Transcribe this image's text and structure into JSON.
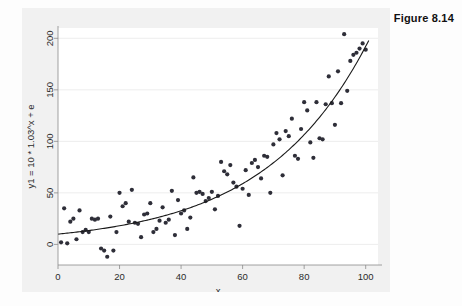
{
  "figure": {
    "caption": "Figure 8.14",
    "background_color": "#f1f1f1",
    "plot_background_color": "#ffffff",
    "point_color": "#2e2e38",
    "curve_color": "#1a1a1a",
    "grid_color": "#e9e9e9"
  },
  "chart_data": {
    "type": "scatter",
    "title": "",
    "subtitle": "",
    "xlabel": "x",
    "ylabel": "y1 = 10 * 1.03^x + e",
    "xlim": [
      0,
      104
    ],
    "ylim": [
      -20,
      210
    ],
    "xticks": [
      0,
      20,
      40,
      60,
      80,
      100
    ],
    "yticks": [
      0,
      50,
      100,
      150,
      200
    ],
    "xticklabels": [
      "0",
      "20",
      "40",
      "60",
      "80",
      "100"
    ],
    "yticklabels": [
      "0",
      "50",
      "100",
      "150",
      "200"
    ],
    "grid": true,
    "grid_axis": "y",
    "legend": false,
    "legend_position": "none",
    "annotations": [],
    "series": [
      {
        "name": "observed",
        "type": "scatter",
        "marker": "circle",
        "points": [
          [
            1,
            2
          ],
          [
            2,
            35
          ],
          [
            3,
            1
          ],
          [
            4,
            22
          ],
          [
            5,
            25
          ],
          [
            6,
            5
          ],
          [
            7,
            33
          ],
          [
            8,
            12
          ],
          [
            9,
            14
          ],
          [
            10,
            12
          ],
          [
            11,
            25
          ],
          [
            12,
            24
          ],
          [
            13,
            25
          ],
          [
            14,
            -4
          ],
          [
            15,
            -6
          ],
          [
            16,
            -12
          ],
          [
            17,
            27
          ],
          [
            18,
            -6
          ],
          [
            19,
            12
          ],
          [
            20,
            50
          ],
          [
            21,
            37
          ],
          [
            22,
            40
          ],
          [
            23,
            22
          ],
          [
            24,
            53
          ],
          [
            25,
            21
          ],
          [
            26,
            20
          ],
          [
            27,
            7
          ],
          [
            28,
            29
          ],
          [
            29,
            30
          ],
          [
            30,
            40
          ],
          [
            31,
            12
          ],
          [
            32,
            15
          ],
          [
            33,
            23
          ],
          [
            34,
            36
          ],
          [
            35,
            21
          ],
          [
            36,
            24
          ],
          [
            37,
            52
          ],
          [
            38,
            9
          ],
          [
            39,
            43
          ],
          [
            40,
            30
          ],
          [
            41,
            33
          ],
          [
            42,
            15
          ],
          [
            43,
            26
          ],
          [
            44,
            65
          ],
          [
            45,
            50
          ],
          [
            46,
            51
          ],
          [
            47,
            49
          ],
          [
            48,
            42
          ],
          [
            49,
            45
          ],
          [
            50,
            51
          ],
          [
            51,
            34
          ],
          [
            52,
            47
          ],
          [
            53,
            80
          ],
          [
            54,
            71
          ],
          [
            55,
            68
          ],
          [
            56,
            77
          ],
          [
            57,
            60
          ],
          [
            58,
            56
          ],
          [
            59,
            18
          ],
          [
            60,
            54
          ],
          [
            61,
            72
          ],
          [
            62,
            48
          ],
          [
            63,
            79
          ],
          [
            64,
            82
          ],
          [
            65,
            75
          ],
          [
            66,
            64
          ],
          [
            67,
            86
          ],
          [
            68,
            85
          ],
          [
            69,
            50
          ],
          [
            70,
            97
          ],
          [
            71,
            108
          ],
          [
            72,
            102
          ],
          [
            73,
            67
          ],
          [
            74,
            110
          ],
          [
            75,
            105
          ],
          [
            76,
            122
          ],
          [
            77,
            86
          ],
          [
            78,
            83
          ],
          [
            79,
            112
          ],
          [
            80,
            138
          ],
          [
            81,
            130
          ],
          [
            82,
            99
          ],
          [
            83,
            84
          ],
          [
            84,
            138
          ],
          [
            85,
            103
          ],
          [
            86,
            102
          ],
          [
            87,
            136
          ],
          [
            88,
            163
          ],
          [
            89,
            137
          ],
          [
            90,
            116
          ],
          [
            91,
            168
          ],
          [
            92,
            137
          ],
          [
            93,
            204
          ],
          [
            94,
            149
          ],
          [
            95,
            178
          ],
          [
            96,
            184
          ],
          [
            97,
            186
          ],
          [
            98,
            190
          ],
          [
            99,
            195
          ],
          [
            100,
            189
          ]
        ]
      },
      {
        "name": "fitted",
        "type": "line",
        "equation": "y = 10 * 1.03^x",
        "a": 10,
        "b": 1.03
      }
    ]
  }
}
